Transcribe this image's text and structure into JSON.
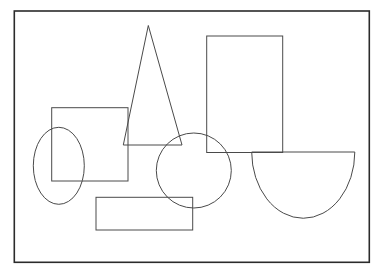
{
  "page": {
    "background_color": "#ffffff",
    "width": 377,
    "height": 269
  },
  "frame": {
    "name": "outer border rectangle",
    "x": 14.3,
    "y": 11,
    "width": 355,
    "height": 251.3,
    "stroke_color": "#2b2b2b",
    "stroke_width": 1.6,
    "fill": "none"
  },
  "shapes": [
    {
      "id": "square",
      "label": "Square",
      "type": "rect",
      "x": 51.7,
      "y": 107.7,
      "width": 76.3,
      "height": 73.3,
      "stroke_color": "#4a4a4a",
      "stroke_width": 1,
      "fill": "none"
    },
    {
      "id": "triangle",
      "label": "Triangle",
      "type": "polygon",
      "points": "148.3,25.5 182,145 123.3,145",
      "stroke_color": "#4a4a4a",
      "stroke_width": 1,
      "fill": "none"
    },
    {
      "id": "tall-rectangle",
      "label": "Tall rectangle",
      "type": "rect",
      "x": 206.7,
      "y": 36,
      "width": 76,
      "height": 116.5,
      "stroke_color": "#4a4a4a",
      "stroke_width": 1,
      "fill": "none"
    },
    {
      "id": "ellipse",
      "label": "Ellipse",
      "type": "ellipse",
      "cx": 58.8,
      "cy": 165.8,
      "rx": 25.5,
      "ry": 38.5,
      "stroke_color": "#4a4a4a",
      "stroke_width": 1,
      "fill": "none"
    },
    {
      "id": "circle",
      "label": "Circle",
      "type": "circle",
      "cx": 193.8,
      "cy": 170.5,
      "r": 37.5,
      "stroke_color": "#4a4a4a",
      "stroke_width": 1,
      "fill": "none"
    },
    {
      "id": "semicircle",
      "label": "Semicircle",
      "type": "path",
      "d": "M 251.7 152 L 354.8 152 A 51.55 66.3 0 0 1 251.7 152 Z",
      "stroke_color": "#4a4a4a",
      "stroke_width": 1,
      "fill": "none"
    },
    {
      "id": "wide-rectangle",
      "label": "Wide rectangle",
      "type": "rect",
      "x": 96,
      "y": 197.3,
      "width": 96.7,
      "height": 32.7,
      "stroke_color": "#4a4a4a",
      "stroke_width": 1,
      "fill": "none"
    }
  ]
}
